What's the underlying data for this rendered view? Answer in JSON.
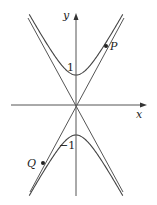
{
  "diagram": {
    "title": "",
    "axes": {
      "x_label": "x",
      "y_label": "y"
    },
    "tick_labels": {
      "upper_vertex": "1",
      "lower_vertex": "−1"
    },
    "points": [
      {
        "name": "P",
        "label": "P",
        "position": "upper-right branch"
      },
      {
        "name": "Q",
        "label": "Q",
        "position": "lower-left branch"
      }
    ],
    "colors": {
      "curve": "#555555",
      "axis": "#555555",
      "text": "#222222",
      "background": "#ffffff"
    }
  }
}
